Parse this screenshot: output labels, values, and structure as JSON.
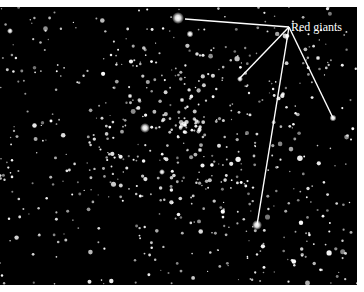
{
  "figure": {
    "annotation_label": "Red giants",
    "annotation_origin": [
      289,
      27
    ],
    "annotated_stars": [
      {
        "x": 185,
        "y": 19
      },
      {
        "x": 239,
        "y": 79
      },
      {
        "x": 333,
        "y": 118
      },
      {
        "x": 257,
        "y": 225
      }
    ],
    "colors": {
      "background": "#000000",
      "stars": "#ffffff",
      "lines": "#ffffff",
      "label": "#ffffff"
    }
  }
}
